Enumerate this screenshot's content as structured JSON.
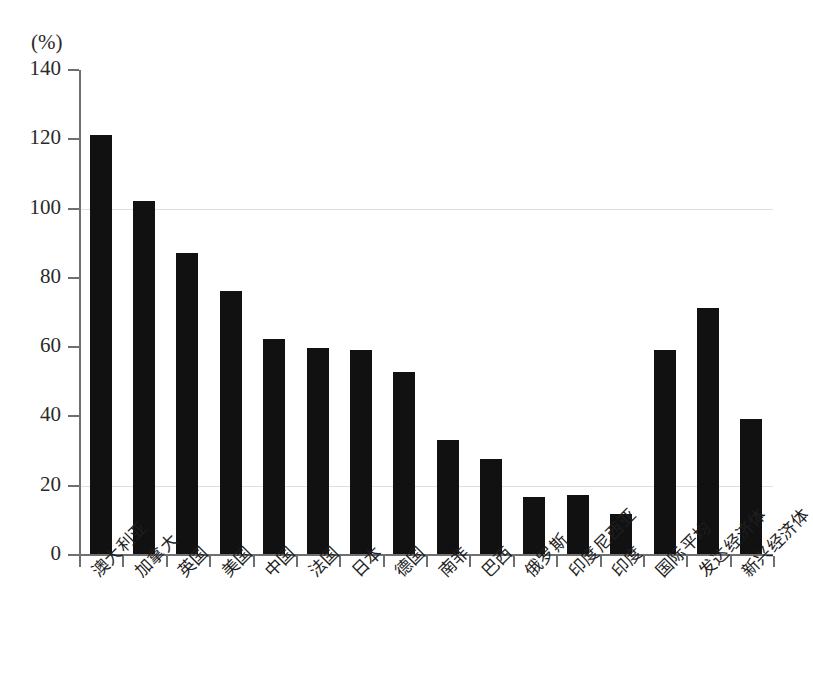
{
  "chart_data": {
    "type": "bar",
    "title": "",
    "subtitle": "",
    "unit_label": "(%)",
    "xlabel": "",
    "ylabel": "",
    "ylim": [
      0,
      140
    ],
    "ytick_step": 20,
    "yticks": [
      0,
      20,
      40,
      60,
      80,
      100,
      120,
      140
    ],
    "ytick_labels": [
      "0",
      "20",
      "40",
      "60",
      "80",
      "100",
      "120",
      "140"
    ],
    "grid": false,
    "legend": null,
    "bar_color": "#111111",
    "axis_color": "#6f6f6f",
    "categories": [
      "澳大利亚",
      "加拿大",
      "英国",
      "美国",
      "中国",
      "法国",
      "日本",
      "德国",
      "南非",
      "巴西",
      "俄罗斯",
      "印度尼西亚",
      "印度",
      "国际平均",
      "发达经济体",
      "新兴经济体"
    ],
    "values": [
      121,
      102,
      87,
      76,
      62,
      59.5,
      59,
      52.5,
      33,
      27.5,
      16.5,
      17,
      11.5,
      59,
      71,
      39
    ]
  },
  "caption": {
    "text": ""
  }
}
